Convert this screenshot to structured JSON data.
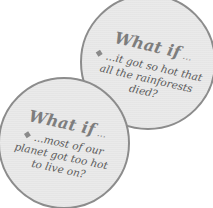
{
  "bubbles": [
    {
      "heading": "What if",
      "heading_ellipsis": " ...",
      "bullet_icon": "diamond-bullet",
      "lines": [
        "...it got so hot that",
        "all the rainforests",
        "died?"
      ]
    },
    {
      "heading": "What if",
      "heading_ellipsis": " ...",
      "bullet_icon": "diamond-bullet",
      "lines": [
        "...most of our",
        "planet got too hot",
        "to live on?"
      ]
    }
  ],
  "colors": {
    "bubble_fill": "#e9e9e9",
    "bubble_border": "#8c8c8c",
    "heading_text": "#7d7d7d",
    "body_text": "#5a5a5a",
    "bullet": "#8a8a8a"
  }
}
